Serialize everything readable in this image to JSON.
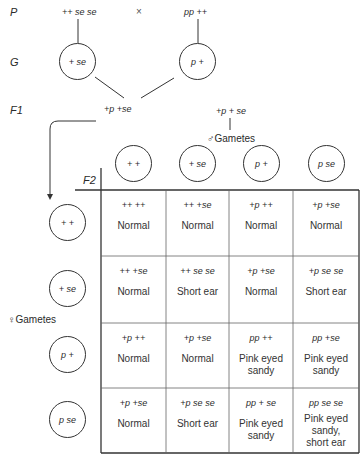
{
  "labels": {
    "parents": "P",
    "gametes": "G",
    "f1": "F1",
    "f2": "F2",
    "cross_symbol": "×",
    "male_gametes": "♂Gametes",
    "female_gametes": "♀Gametes"
  },
  "parents": {
    "left": "++ se se",
    "right": "pp ++"
  },
  "parent_gametes": {
    "left": "+ se",
    "right": "p +"
  },
  "f1": {
    "left": "+p +se",
    "right": "+p + se"
  },
  "male_gametes": [
    "+ +",
    "+ se",
    "p +",
    "p se"
  ],
  "female_gametes": [
    "+ +",
    "+ se",
    "p +",
    "p se"
  ],
  "punnett": [
    [
      {
        "genotype": "++ ++",
        "phenotype": "Normal"
      },
      {
        "genotype": "++ +se",
        "phenotype": "Normal"
      },
      {
        "genotype": "+p ++",
        "phenotype": "Normal"
      },
      {
        "genotype": "+p +se",
        "phenotype": "Normal"
      }
    ],
    [
      {
        "genotype": "++ +se",
        "phenotype": "Normal"
      },
      {
        "genotype": "++ se se",
        "phenotype": "Short ear"
      },
      {
        "genotype": "+p +se",
        "phenotype": "Normal"
      },
      {
        "genotype": "+p se se",
        "phenotype": "Short ear"
      }
    ],
    [
      {
        "genotype": "+p ++",
        "phenotype": "Normal"
      },
      {
        "genotype": "+p +se",
        "phenotype": "Normal"
      },
      {
        "genotype": "pp ++",
        "phenotype": "Pink eyed sandy"
      },
      {
        "genotype": "pp +se",
        "phenotype": "Pink eyed sandy"
      }
    ],
    [
      {
        "genotype": "+p +se",
        "phenotype": "Normal"
      },
      {
        "genotype": "+p se se",
        "phenotype": "Short ear"
      },
      {
        "genotype": "pp + se",
        "phenotype": "Pink eyed sandy"
      },
      {
        "genotype": "pp se se",
        "phenotype": "Pink eyed sandy, short ear"
      }
    ]
  ]
}
